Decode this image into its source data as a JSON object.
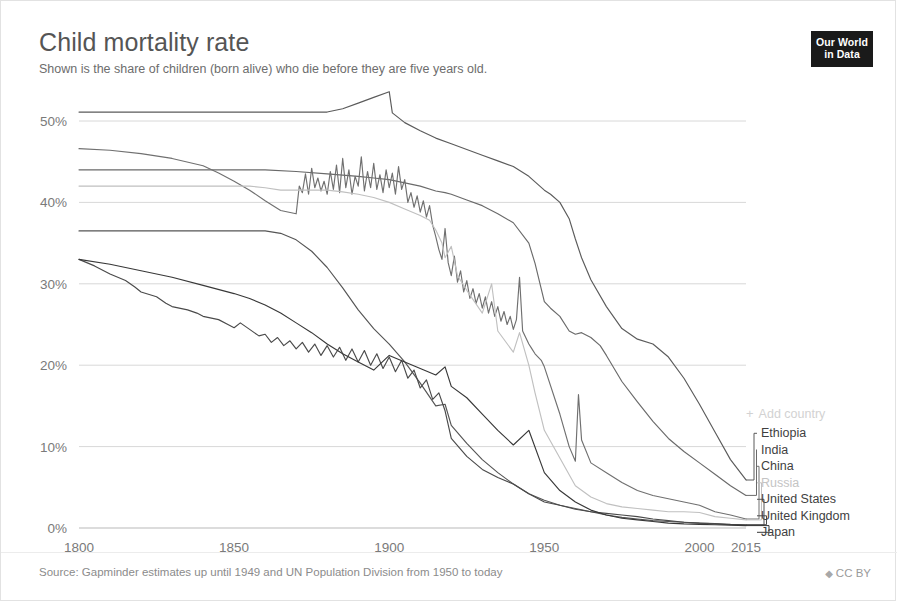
{
  "header": {
    "title": "Child mortality rate",
    "subtitle": "Shown is the share of children (born alive) who die before they are five years old."
  },
  "logo": {
    "line1": "Our World",
    "line2": "in Data"
  },
  "footer": {
    "source": "Source: Gapminder estimates up until 1949 and UN Population Division from 1950 to today",
    "license": "CC BY",
    "license_icon": "up-down-chevron-icon"
  },
  "legend": {
    "add_country_label": "Add country",
    "add_country_icon": "plus-icon",
    "entries": [
      {
        "label": "Ethiopia",
        "color": "#5b5b5b"
      },
      {
        "label": "India",
        "color": "#6a6a6a"
      },
      {
        "label": "China",
        "color": "#707070"
      },
      {
        "label": "Russia",
        "color": "#c0c0c0"
      },
      {
        "label": "United States",
        "color": "#555555"
      },
      {
        "label": "United Kingdom",
        "color": "#4a4a4a"
      },
      {
        "label": "Japan",
        "color": "#383838"
      }
    ]
  },
  "chart_data": {
    "type": "line",
    "title": "Child mortality rate",
    "subtitle": "Shown is the share of children (born alive) who die before they are five years old.",
    "xlabel": "",
    "ylabel": "",
    "xlim": [
      1800,
      2015
    ],
    "ylim": [
      0,
      55
    ],
    "grid": true,
    "legend_position": "right",
    "y_unit": "%",
    "y_ticks": [
      0,
      10,
      20,
      30,
      40,
      50
    ],
    "y_tick_labels": [
      "0%",
      "10%",
      "20%",
      "30%",
      "40%",
      "50%"
    ],
    "x_ticks": [
      1800,
      1850,
      1900,
      1950,
      2000,
      2015
    ],
    "x_tick_labels": [
      "1800",
      "1850",
      "1900",
      "1950",
      "2000",
      "2015"
    ],
    "series": [
      {
        "name": "Ethiopia",
        "color": "#5b5b5b",
        "x": [
          1800,
          1810,
          1820,
          1830,
          1840,
          1850,
          1860,
          1865,
          1870,
          1875,
          1880,
          1885,
          1890,
          1895,
          1900,
          1901,
          1905,
          1910,
          1915,
          1920,
          1925,
          1930,
          1935,
          1940,
          1945,
          1950,
          1952,
          1955,
          1958,
          1960,
          1962,
          1965,
          1970,
          1975,
          1980,
          1985,
          1990,
          1995,
          2000,
          2005,
          2010,
          2015
        ],
        "y": [
          51.1,
          51.1,
          51.1,
          51.1,
          51.1,
          51.1,
          51.1,
          51.1,
          51.1,
          51.1,
          51.1,
          51.5,
          52.2,
          52.9,
          53.6,
          51.0,
          49.8,
          48.8,
          47.9,
          47.2,
          46.5,
          45.8,
          45.1,
          44.4,
          43.2,
          41.5,
          41.0,
          40.0,
          38.0,
          35.5,
          33.2,
          30.5,
          27.2,
          24.5,
          23.2,
          22.6,
          21.0,
          18.4,
          15.2,
          11.8,
          8.4,
          5.9
        ]
      },
      {
        "name": "India",
        "color": "#6a6a6a",
        "x": [
          1800,
          1820,
          1840,
          1860,
          1870,
          1880,
          1890,
          1895,
          1900,
          1905,
          1910,
          1915,
          1918,
          1920,
          1925,
          1930,
          1935,
          1940,
          1945,
          1947,
          1950,
          1952,
          1955,
          1958,
          1960,
          1962,
          1965,
          1968,
          1970,
          1975,
          1980,
          1985,
          1990,
          1995,
          2000,
          2005,
          2010,
          2015
        ],
        "y": [
          44.0,
          44.0,
          44.0,
          44.0,
          43.8,
          43.5,
          43.2,
          43.0,
          42.8,
          42.4,
          42.0,
          41.4,
          41.2,
          41.0,
          40.3,
          39.6,
          38.6,
          37.5,
          35.0,
          32.5,
          27.8,
          27.0,
          26.0,
          24.2,
          23.8,
          24.0,
          23.4,
          22.4,
          21.2,
          18.0,
          15.5,
          13.1,
          11.0,
          9.4,
          8.0,
          6.6,
          5.2,
          4.0
        ]
      },
      {
        "name": "China",
        "color": "#707070",
        "x": [
          1800,
          1810,
          1820,
          1830,
          1840,
          1845,
          1850,
          1855,
          1860,
          1865,
          1870,
          1871,
          1872,
          1873,
          1874,
          1875,
          1876,
          1877,
          1878,
          1879,
          1880,
          1881,
          1882,
          1883,
          1884,
          1885,
          1886,
          1887,
          1888,
          1889,
          1890,
          1891,
          1892,
          1893,
          1894,
          1895,
          1896,
          1897,
          1898,
          1899,
          1900,
          1901,
          1902,
          1903,
          1904,
          1905,
          1906,
          1907,
          1908,
          1909,
          1910,
          1911,
          1912,
          1913,
          1914,
          1915,
          1916,
          1917,
          1918,
          1919,
          1920,
          1921,
          1922,
          1923,
          1924,
          1925,
          1926,
          1927,
          1928,
          1929,
          1930,
          1931,
          1932,
          1933,
          1934,
          1935,
          1936,
          1937,
          1938,
          1939,
          1940,
          1941,
          1942,
          1943,
          1944,
          1945,
          1946,
          1947,
          1948,
          1949,
          1950,
          1955,
          1958,
          1960,
          1961,
          1962,
          1965,
          1970,
          1975,
          1980,
          1985,
          1990,
          1995,
          2000,
          2005,
          2010,
          2015
        ],
        "y": [
          46.6,
          46.4,
          46.0,
          45.4,
          44.5,
          43.6,
          42.6,
          41.5,
          40.2,
          39.0,
          38.6,
          42.0,
          41.2,
          43.5,
          41.0,
          44.2,
          41.8,
          43.0,
          41.4,
          42.6,
          41.0,
          43.8,
          41.6,
          44.6,
          41.2,
          45.4,
          41.8,
          44.0,
          41.0,
          43.2,
          42.0,
          45.6,
          41.4,
          43.8,
          41.8,
          44.8,
          41.6,
          43.4,
          41.2,
          44.0,
          41.8,
          43.6,
          41.0,
          44.4,
          41.6,
          42.8,
          40.0,
          41.2,
          39.4,
          40.8,
          38.8,
          40.2,
          38.2,
          39.6,
          37.2,
          35.8,
          34.2,
          33.0,
          36.8,
          32.6,
          31.0,
          33.4,
          30.2,
          31.6,
          29.0,
          30.4,
          28.2,
          29.4,
          27.6,
          28.8,
          27.0,
          28.4,
          26.4,
          27.8,
          26.0,
          27.2,
          25.4,
          26.6,
          25.0,
          26.0,
          24.4,
          25.6,
          30.8,
          24.2,
          23.4,
          22.6,
          22.0,
          21.4,
          21.0,
          20.6,
          19.8,
          14.0,
          10.0,
          8.2,
          16.4,
          10.8,
          8.0,
          6.8,
          5.6,
          4.6,
          4.0,
          3.6,
          3.2,
          2.8,
          2.0,
          1.6,
          1.1
        ]
      },
      {
        "name": "Russia",
        "color": "#c0c0c0",
        "x": [
          1800,
          1820,
          1840,
          1855,
          1860,
          1865,
          1870,
          1875,
          1880,
          1885,
          1890,
          1895,
          1900,
          1905,
          1910,
          1913,
          1915,
          1917,
          1918,
          1920,
          1922,
          1925,
          1930,
          1933,
          1935,
          1940,
          1942,
          1945,
          1947,
          1950,
          1955,
          1960,
          1965,
          1970,
          1975,
          1980,
          1985,
          1990,
          1995,
          2000,
          2005,
          2010,
          2015
        ],
        "y": [
          42.0,
          42.0,
          42.0,
          42.0,
          41.8,
          41.5,
          41.5,
          41.5,
          41.5,
          41.3,
          41.0,
          40.6,
          40.0,
          39.2,
          38.4,
          37.8,
          36.6,
          35.0,
          33.2,
          34.6,
          31.0,
          29.2,
          26.4,
          30.0,
          24.2,
          21.6,
          24.0,
          20.0,
          16.6,
          12.0,
          8.6,
          5.2,
          3.8,
          3.0,
          2.6,
          2.4,
          2.2,
          2.0,
          2.0,
          1.9,
          1.4,
          1.2,
          1.0
        ]
      },
      {
        "name": "United States",
        "color": "#555555",
        "x": [
          1800,
          1820,
          1840,
          1850,
          1855,
          1858,
          1860,
          1865,
          1870,
          1875,
          1880,
          1885,
          1890,
          1895,
          1900,
          1905,
          1910,
          1915,
          1918,
          1920,
          1925,
          1930,
          1935,
          1940,
          1945,
          1950,
          1955,
          1960,
          1965,
          1970,
          1975,
          1980,
          1985,
          1990,
          1995,
          2000,
          2005,
          2010,
          2015
        ],
        "y": [
          36.5,
          36.5,
          36.5,
          36.5,
          36.5,
          36.5,
          36.5,
          36.2,
          35.4,
          34.0,
          32.0,
          29.5,
          26.8,
          24.5,
          22.6,
          20.4,
          17.8,
          15.0,
          15.2,
          12.6,
          10.4,
          8.4,
          6.8,
          5.4,
          4.2,
          3.4,
          2.8,
          2.4,
          2.0,
          1.6,
          1.3,
          1.1,
          0.9,
          0.8,
          0.7,
          0.6,
          0.5,
          0.4,
          0.35
        ]
      },
      {
        "name": "United Kingdom",
        "color": "#4a4a4a",
        "x": [
          1800,
          1805,
          1810,
          1815,
          1818,
          1820,
          1825,
          1828,
          1830,
          1835,
          1838,
          1840,
          1845,
          1848,
          1850,
          1852,
          1855,
          1858,
          1860,
          1862,
          1864,
          1866,
          1868,
          1870,
          1872,
          1874,
          1876,
          1878,
          1880,
          1882,
          1884,
          1886,
          1888,
          1890,
          1892,
          1894,
          1896,
          1898,
          1900,
          1902,
          1904,
          1906,
          1908,
          1910,
          1912,
          1914,
          1916,
          1918,
          1920,
          1925,
          1930,
          1935,
          1940,
          1945,
          1950,
          1955,
          1960,
          1965,
          1970,
          1975,
          1980,
          1985,
          1990,
          1995,
          2000,
          2005,
          2010,
          2015
        ],
        "y": [
          33.0,
          32.2,
          31.2,
          30.4,
          29.6,
          29.0,
          28.4,
          27.6,
          27.2,
          26.8,
          26.4,
          26.0,
          25.6,
          25.0,
          24.6,
          25.2,
          24.4,
          23.6,
          23.8,
          22.8,
          23.4,
          22.4,
          23.0,
          22.0,
          22.8,
          21.6,
          22.6,
          21.2,
          22.4,
          21.0,
          22.2,
          20.6,
          22.0,
          20.4,
          21.8,
          20.0,
          21.4,
          19.6,
          21.0,
          19.2,
          20.6,
          18.4,
          19.4,
          17.2,
          18.2,
          15.8,
          16.6,
          14.4,
          11.0,
          8.8,
          7.2,
          6.2,
          5.4,
          4.2,
          3.2,
          2.8,
          2.3,
          2.0,
          1.8,
          1.6,
          1.4,
          1.1,
          0.9,
          0.7,
          0.6,
          0.55,
          0.45,
          0.4
        ]
      },
      {
        "name": "Japan",
        "color": "#383838",
        "x": [
          1800,
          1810,
          1820,
          1830,
          1840,
          1850,
          1855,
          1860,
          1865,
          1870,
          1875,
          1880,
          1885,
          1890,
          1895,
          1900,
          1905,
          1910,
          1915,
          1918,
          1920,
          1925,
          1930,
          1935,
          1940,
          1945,
          1950,
          1955,
          1960,
          1965,
          1970,
          1975,
          1980,
          1985,
          1990,
          1995,
          2000,
          2005,
          2010,
          2015
        ],
        "y": [
          33.0,
          32.4,
          31.6,
          30.8,
          29.8,
          28.8,
          28.2,
          27.4,
          26.4,
          25.2,
          24.0,
          22.6,
          21.4,
          20.4,
          19.4,
          21.2,
          20.4,
          19.6,
          18.8,
          19.8,
          17.4,
          16.0,
          14.0,
          12.0,
          10.2,
          12.0,
          6.8,
          4.6,
          3.2,
          2.2,
          1.6,
          1.2,
          1.0,
          0.8,
          0.6,
          0.5,
          0.45,
          0.4,
          0.35,
          0.3
        ]
      }
    ]
  }
}
